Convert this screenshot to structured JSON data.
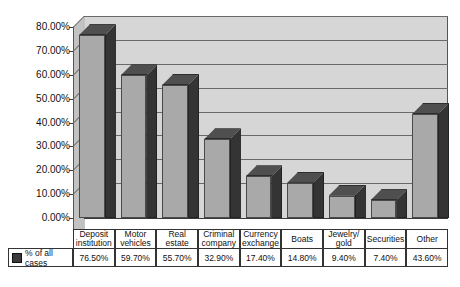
{
  "chart_data": {
    "type": "bar",
    "title": "",
    "xlabel": "",
    "ylabel": "",
    "ylim": [
      0,
      80
    ],
    "ytick_labels": [
      "80.00%",
      "70.00%",
      "60.00%",
      "50.00%",
      "40.00%",
      "30.00%",
      "20.00%",
      "10.00%",
      "0.00%"
    ],
    "ytick_values": [
      80,
      70,
      60,
      50,
      40,
      30,
      20,
      10,
      0
    ],
    "grid": true,
    "legend_position": "bottom-left-table",
    "categories": [
      "Deposit institution",
      "Motor vehicles",
      "Real estate",
      "Criminal company",
      "Currency exchange",
      "Boats",
      "Jewelry/ gold",
      "Securities",
      "Other"
    ],
    "series": [
      {
        "name": "% of all cases",
        "values": [
          76.5,
          59.7,
          55.7,
          32.9,
          17.4,
          14.8,
          9.4,
          7.4,
          43.6
        ],
        "value_labels": [
          "76.50%",
          "59.70%",
          "55.70%",
          "32.90%",
          "17.40%",
          "14.80%",
          "9.40%",
          "7.40%",
          "43.60%"
        ]
      }
    ]
  },
  "table": {
    "legend_label": "% of all cases",
    "legend_marker": "series-color-swatch",
    "header_lines": [
      [
        "Deposit",
        "institution"
      ],
      [
        "Motor",
        "vehicles"
      ],
      [
        "Real estate",
        ""
      ],
      [
        "Criminal",
        "company"
      ],
      [
        "Currency",
        "exchange"
      ],
      [
        "Boats",
        ""
      ],
      [
        "Jewelry/",
        "gold"
      ],
      [
        "Securities",
        ""
      ],
      [
        "Other",
        ""
      ]
    ]
  },
  "colors": {
    "bar_front": "#a9a9a9",
    "bar_side": "#343434",
    "bar_top": "#4f4f4f",
    "plot_background": "#d6d6d6",
    "wall_side": "#c2c2c2",
    "gridline": "#6a6a6a",
    "text": "#111111"
  }
}
